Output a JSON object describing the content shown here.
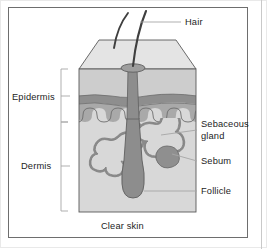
{
  "figure": {
    "kind": "anatomical-diagram",
    "caption": "Clear skin"
  },
  "labels": {
    "epidermis": "Epidermis",
    "dermis": "Dermis",
    "hair": "Hair",
    "sebaceous_gland_line1": "Sebaceous",
    "sebaceous_gland_line2": "gland",
    "sebum": "Sebum",
    "follicle": "Follicle",
    "caption": "Clear skin"
  },
  "colors": {
    "frame_outer": "#e9e9e9",
    "frame_inner": "#6e6e6e",
    "text": "#1d1d1d",
    "leader_line": "#9a9a9a",
    "block_top_face": "#e3e3e3",
    "epidermis_upper": "#cfcfcf",
    "epidermis_band": "#8f8f8f",
    "epidermis_lower": "#a8a8a8",
    "dermis": "#d6d6d6",
    "outline": "#5a5a5a",
    "hair_shaft": "#4f4f4f",
    "follicle_fill": "#9a9a9a",
    "gland_fill": "#d6d6d6",
    "gland_outline": "#8a8a8a",
    "sebum_fill": "#8f8f8f"
  },
  "structures": [
    {
      "name": "hair",
      "label": "Hair",
      "position": "above skin surface"
    },
    {
      "name": "epidermis",
      "label": "Epidermis",
      "position": "upper skin layer"
    },
    {
      "name": "dermis",
      "label": "Dermis",
      "position": "lower skin layer"
    },
    {
      "name": "sebaceous-gland",
      "label": "Sebaceous gland",
      "position": "mid dermis, flanking follicle"
    },
    {
      "name": "sebum",
      "label": "Sebum",
      "position": "right lobe of sebaceous gland"
    },
    {
      "name": "follicle",
      "label": "Follicle",
      "position": "deep dermis, base of hair"
    }
  ]
}
